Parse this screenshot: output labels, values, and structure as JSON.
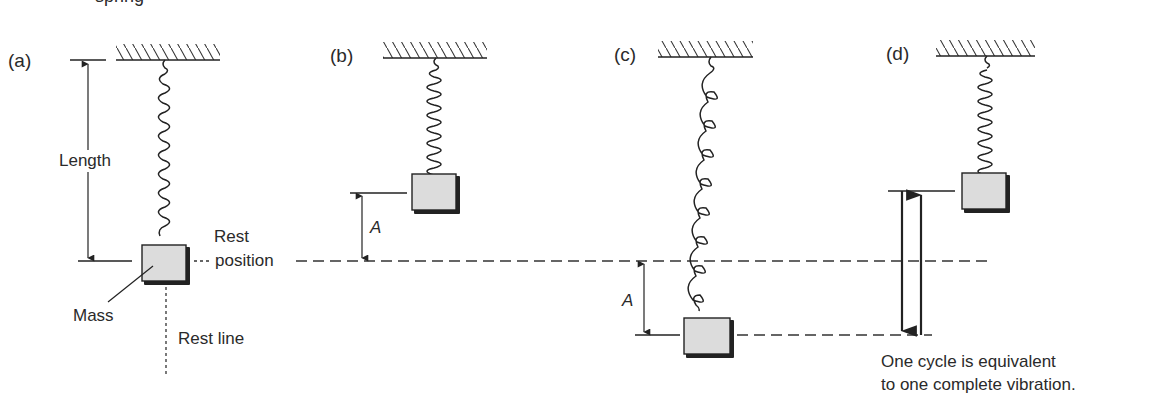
{
  "figure": {
    "title_fragment": "spring",
    "panels": [
      {
        "id": "a",
        "label": "(a)"
      },
      {
        "id": "b",
        "label": "(b)"
      },
      {
        "id": "c",
        "label": "(c)"
      },
      {
        "id": "d",
        "label": "(d)"
      }
    ],
    "annotations": {
      "length": "Length",
      "rest": "Rest",
      "position": "position",
      "mass": "Mass",
      "rest_line": "Rest line",
      "amplitude_b": "A",
      "amplitude_c": "A"
    },
    "caption": {
      "line1": "One cycle is equivalent",
      "line2": "to one complete vibration."
    }
  },
  "colors": {
    "ink": "#222222",
    "mass_fill": "#dcdcdc",
    "background": "#ffffff"
  }
}
